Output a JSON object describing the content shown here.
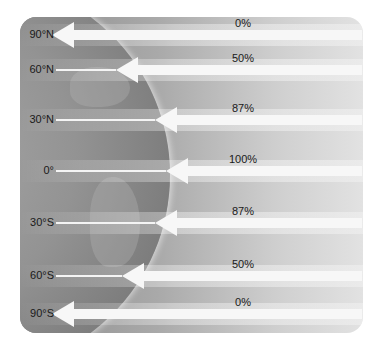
{
  "diagram": {
    "rows": [
      {
        "latitude": "90°N",
        "percent": "0%",
        "y": 35,
        "arrow_tip_x": 52
      },
      {
        "latitude": "60°N",
        "percent": "50%",
        "y": 70,
        "arrow_tip_x": 116
      },
      {
        "latitude": "30°N",
        "percent": "87%",
        "y": 120,
        "arrow_tip_x": 155
      },
      {
        "latitude": "0°",
        "percent": "100%",
        "y": 171,
        "arrow_tip_x": 166
      },
      {
        "latitude": "30°S",
        "percent": "87%",
        "y": 223,
        "arrow_tip_x": 155
      },
      {
        "latitude": "60°S",
        "percent": "50%",
        "y": 276,
        "arrow_tip_x": 122
      },
      {
        "latitude": "90°S",
        "percent": "0%",
        "y": 314,
        "arrow_tip_x": 52
      }
    ]
  },
  "chart_data": {
    "type": "table",
    "columns": [
      "Latitude",
      "Relative intensity"
    ],
    "rows": [
      [
        "90°N",
        "0%"
      ],
      [
        "60°N",
        "50%"
      ],
      [
        "30°N",
        "87%"
      ],
      [
        "0°",
        "100%"
      ],
      [
        "30°S",
        "87%"
      ],
      [
        "60°S",
        "50%"
      ],
      [
        "90°S",
        "0%"
      ]
    ]
  },
  "colors": {
    "arrow": "#f7f7f7",
    "panel": "#a9a9a9",
    "text": "#1a1a1a"
  }
}
